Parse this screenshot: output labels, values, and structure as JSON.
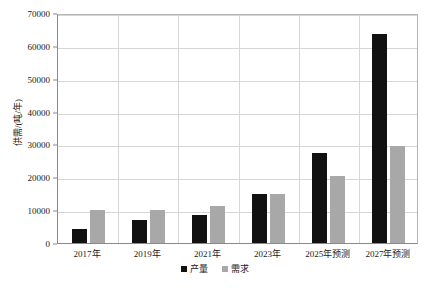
{
  "chart_data": {
    "type": "bar",
    "title": "",
    "xlabel": "",
    "ylabel": "供需/(吨/年)",
    "categories": [
      "2017年",
      "2019年",
      "2021年",
      "2023年",
      "2025年预测",
      "2027年预测"
    ],
    "series": [
      {
        "name": "产量",
        "color": "#111111",
        "values": [
          4200,
          7000,
          8500,
          15000,
          27500,
          63500
        ]
      },
      {
        "name": "需求",
        "color": "#a8a8a8",
        "values": [
          10000,
          10000,
          11200,
          15000,
          20500,
          29500
        ]
      }
    ],
    "ylim": [
      0,
      70000
    ],
    "ytick_values": [
      0,
      10000,
      20000,
      30000,
      40000,
      50000,
      60000,
      70000
    ],
    "ytick_labels": [
      "0",
      "10000",
      "20000",
      "30000",
      "40000",
      "50000",
      "60000",
      "70000"
    ],
    "grid": true,
    "legend_position": "bottom",
    "legend_entries": [
      "产量",
      "需求"
    ]
  }
}
